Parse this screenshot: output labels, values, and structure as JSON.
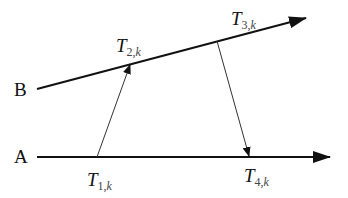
{
  "diagram": {
    "type": "timing-message-exchange",
    "nodes": [
      {
        "id": "A",
        "label": "A"
      },
      {
        "id": "B",
        "label": "B"
      }
    ],
    "timestamps": [
      {
        "id": "T1",
        "var": "T",
        "sub_num": "1,",
        "sub_k": "k",
        "full": "T1,k"
      },
      {
        "id": "T2",
        "var": "T",
        "sub_num": "2,",
        "sub_k": "k",
        "full": "T2,k"
      },
      {
        "id": "T3",
        "var": "T",
        "sub_num": "3,",
        "sub_k": "k",
        "full": "T3,k"
      },
      {
        "id": "T4",
        "var": "T",
        "sub_num": "4,",
        "sub_k": "k",
        "full": "T4,k"
      }
    ],
    "edges": [
      {
        "from": "T1",
        "to": "T2",
        "description": "message A to B"
      },
      {
        "from": "T3",
        "to": "T4",
        "description": "message B to A"
      }
    ],
    "colors": {
      "line": "#111111",
      "message": "#333333",
      "background": "#ffffff"
    }
  }
}
